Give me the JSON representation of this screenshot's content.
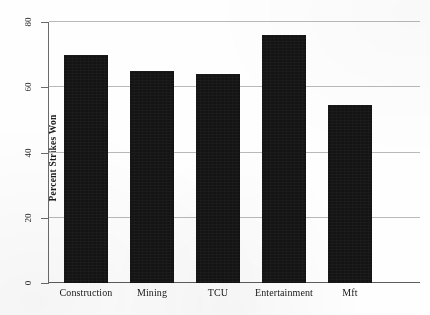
{
  "chart_data": {
    "type": "bar",
    "title": "",
    "subtitle": "",
    "xlabel": "",
    "ylabel": "Percent Strikes Won",
    "categories": [
      "Construction",
      "Mining",
      "TCU",
      "Entertainment",
      "Mft"
    ],
    "values": [
      70,
      65,
      64,
      76,
      54.5
    ],
    "ylim": [
      0,
      80
    ],
    "yticks": [
      0,
      20,
      40,
      60,
      80
    ],
    "ytick_labels": [
      "0",
      "20",
      "40",
      "60",
      "80"
    ],
    "grid": "horizontal",
    "legend": "none",
    "series": [
      {
        "name": "Percent Strikes Won",
        "values": [
          70,
          65,
          64,
          76,
          54.5
        ],
        "color": "#141414"
      }
    ],
    "annotations": []
  },
  "style": {
    "bar_color": "#141414",
    "grid_color": "#b9b9b9",
    "axis_color": "#6a6a6a",
    "background": "#fefefe",
    "text_color": "#1d1d1d"
  }
}
